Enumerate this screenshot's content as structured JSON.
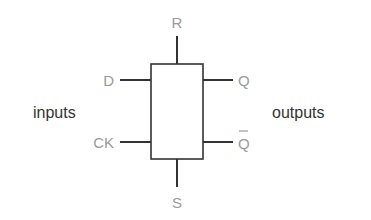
{
  "diagram": {
    "title": "",
    "component": "D flip-flop block",
    "side_labels": {
      "left": "inputs",
      "right": "outputs"
    },
    "pins": {
      "top": "R",
      "bottom": "S",
      "left_top": "D",
      "left_bottom": "CK",
      "right_top": "Q",
      "right_bottom": "Q"
    },
    "colors": {
      "pin_label": "#9a9a9a",
      "side_label": "#333333",
      "lines": "#333333",
      "background": "#ffffff"
    }
  }
}
